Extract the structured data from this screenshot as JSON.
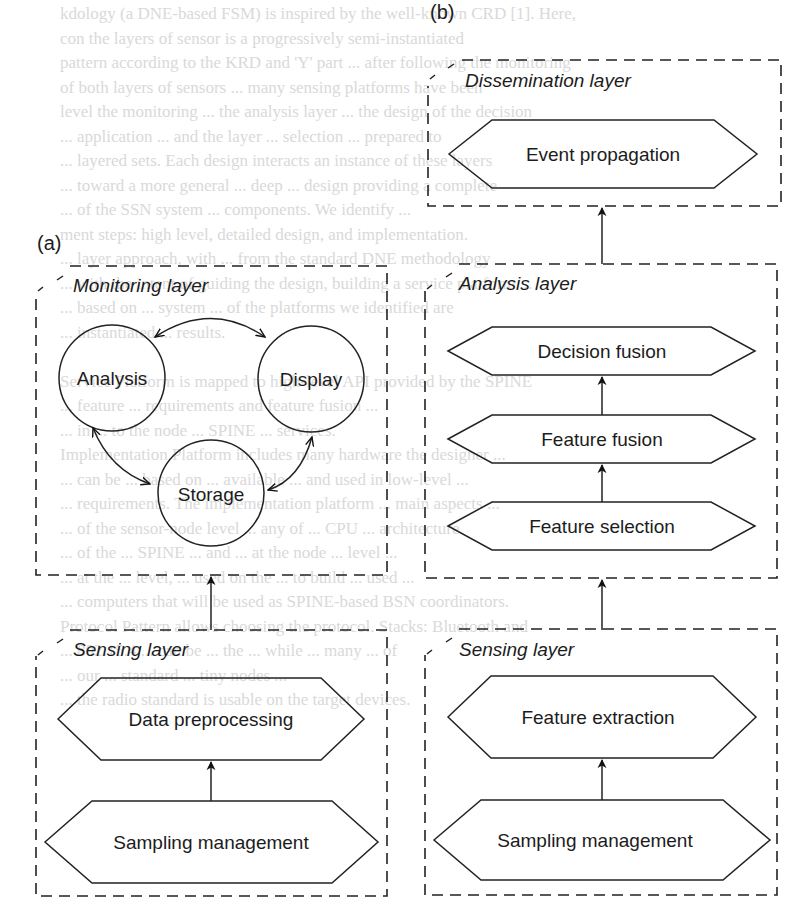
{
  "background_text": {
    "lines": [
      "kdology (a DNE-based FSM) is inspired by the well-known CRD [1]. Here,",
      "con the layers of sensor is a progressively semi-instantiated",
      "pattern according to the KRD and 'Y' part ... after following the monitoring",
      "of both layers of sensors ... many sensing platforms have been",
      "level the monitoring ... the analysis layer ... the design of the decision",
      "... application ... and the layer ... selection ... prepared to",
      "... layered sets. Each design interacts an instance of these layers",
      "... toward a more general ... deep ... design providing a complete",
      "... of the SSN system ... components. We identify ...",
      "ment steps: high level, detailed design, and implementation.",
      "... layer approach, with ... from the standard DNE methodology",
      "... with the intent of guiding the design, building a service platform ...",
      "... based on ... system ... of the platforms we identified are",
      "... instantiated ... results.",
      "",
      "Service Platform is mapped to high-level API provided by the SPINE",
      "... feature ... requirements and feature fusion ...",
      "... in ... to the node ... SPINE ... services.",
      "Implementation Platform includes many hardware the designer ...",
      "... can be ... based on ... available ... and used in low-level ...",
      "... requirements. The implementation platform ... main aspects ...",
      "... of the sensor-node level ... any of ... CPU ... architecture",
      "... of the ... SPINE ... and ... at the node ... level ...",
      "... at the ... level, ... used on the ... to build ... used ...",
      "... computers that will be used as SPINE-based BSN coordinators.",
      "Protocol Pattern allows choosing the protocol. Stacks: Bluetooth and",
      "... 802.15.4 ... can be ... the ... while ... many ... of",
      "... our ... standard ... tiny nodes ...",
      "... the radio standard is usable on the target devices."
    ]
  },
  "panel_a": {
    "label": "(a)",
    "monitoring_layer": {
      "title": "Monitoring layer",
      "nodes": [
        "Analysis",
        "Display",
        "Storage"
      ],
      "edges": [
        {
          "from": "Analysis",
          "to": "Display",
          "type": "bidirectional"
        },
        {
          "from": "Analysis",
          "to": "Storage",
          "type": "bidirectional"
        },
        {
          "from": "Display",
          "to": "Storage",
          "type": "bidirectional"
        }
      ]
    },
    "sensing_layer": {
      "title": "Sensing layer",
      "blocks": [
        "Data preprocessing",
        "Sampling management"
      ]
    },
    "flow": [
      {
        "from": "Sampling management",
        "to": "Data preprocessing"
      },
      {
        "from": "Sensing layer",
        "to": "Monitoring layer"
      }
    ]
  },
  "panel_b": {
    "label": "(b)",
    "dissemination_layer": {
      "title": "Dissemination layer",
      "blocks": [
        "Event propagation"
      ]
    },
    "analysis_layer": {
      "title": "Analysis layer",
      "blocks": [
        "Decision fusion",
        "Feature fusion",
        "Feature selection"
      ]
    },
    "sensing_layer": {
      "title": "Sensing layer",
      "blocks": [
        "Feature extraction",
        "Sampling management"
      ]
    },
    "flow": [
      {
        "from": "Sampling management",
        "to": "Feature extraction"
      },
      {
        "from": "Sensing layer",
        "to": "Analysis layer"
      },
      {
        "from": "Feature selection",
        "to": "Feature fusion"
      },
      {
        "from": "Feature fusion",
        "to": "Decision fusion"
      },
      {
        "from": "Analysis layer",
        "to": "Dissemination layer"
      }
    ]
  }
}
